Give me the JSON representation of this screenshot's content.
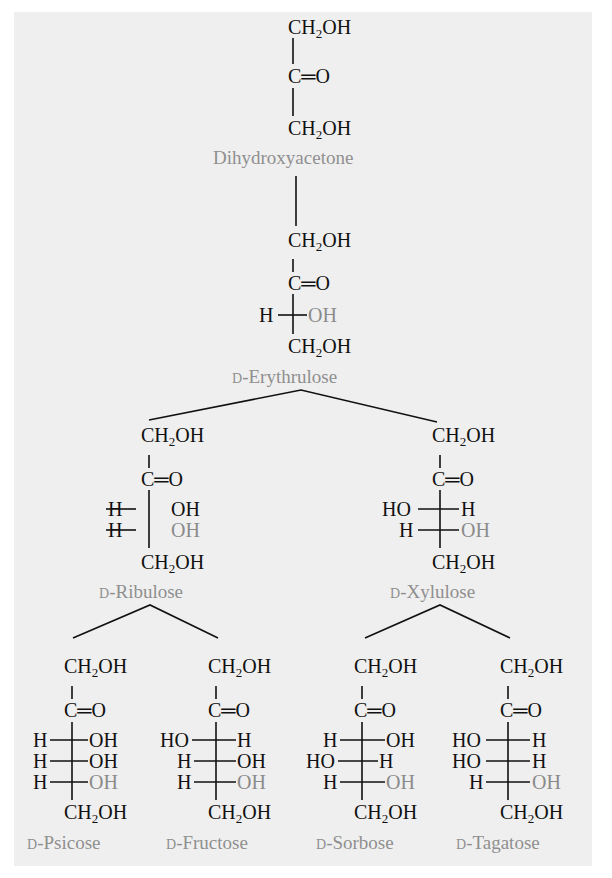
{
  "diagram": {
    "colors": {
      "background": "#efefef",
      "text": "#111111",
      "label": "#8f8f8f",
      "highlight_oh": "#8a8a8a"
    },
    "group_labels": {
      "ch2oh_prefix": "CH",
      "ch2oh_sub": "2",
      "ch2oh_suffix": "OH",
      "carbonyl": "C═O"
    },
    "nodes": [
      {
        "id": "dihydroxyacetone",
        "label": "Dihydroxyacetone",
        "prefix": "",
        "name": "Dihydroxyacetone",
        "carbons": 3,
        "chiral_rows": []
      },
      {
        "id": "erythrulose",
        "prefix": "D",
        "name": "-Erythrulose",
        "carbons": 4,
        "chiral_rows": [
          {
            "left": "H",
            "right": "OH",
            "right_gray": true
          }
        ]
      },
      {
        "id": "ribulose",
        "prefix": "D",
        "name": "-Ribulose",
        "carbons": 5,
        "chiral_rows": [
          {
            "left": "H",
            "right": "OH"
          },
          {
            "left": "H",
            "right": "OH",
            "right_gray": true
          }
        ]
      },
      {
        "id": "xylulose",
        "prefix": "D",
        "name": "-Xylulose",
        "carbons": 5,
        "chiral_rows": [
          {
            "left": "HO",
            "right": "H"
          },
          {
            "left": "H",
            "right": "OH",
            "right_gray": true
          }
        ]
      },
      {
        "id": "psicose",
        "prefix": "D",
        "name": "-Psicose",
        "carbons": 6,
        "chiral_rows": [
          {
            "left": "H",
            "right": "OH"
          },
          {
            "left": "H",
            "right": "OH"
          },
          {
            "left": "H",
            "right": "OH",
            "right_gray": true
          }
        ]
      },
      {
        "id": "fructose",
        "prefix": "D",
        "name": "-Fructose",
        "carbons": 6,
        "chiral_rows": [
          {
            "left": "HO",
            "right": "H"
          },
          {
            "left": "H",
            "right": "OH"
          },
          {
            "left": "H",
            "right": "OH",
            "right_gray": true
          }
        ]
      },
      {
        "id": "sorbose",
        "prefix": "D",
        "name": "-Sorbose",
        "carbons": 6,
        "chiral_rows": [
          {
            "left": "H",
            "right": "OH"
          },
          {
            "left": "HO",
            "right": "H"
          },
          {
            "left": "H",
            "right": "OH",
            "right_gray": true
          }
        ]
      },
      {
        "id": "tagatose",
        "prefix": "D",
        "name": "-Tagatose",
        "carbons": 6,
        "chiral_rows": [
          {
            "left": "HO",
            "right": "H"
          },
          {
            "left": "HO",
            "right": "H"
          },
          {
            "left": "H",
            "right": "OH",
            "right_gray": true
          }
        ]
      }
    ],
    "edges": [
      [
        "dihydroxyacetone",
        "erythrulose"
      ],
      [
        "erythrulose",
        "ribulose"
      ],
      [
        "erythrulose",
        "xylulose"
      ],
      [
        "ribulose",
        "psicose"
      ],
      [
        "ribulose",
        "fructose"
      ],
      [
        "xylulose",
        "sorbose"
      ],
      [
        "xylulose",
        "tagatose"
      ]
    ]
  }
}
